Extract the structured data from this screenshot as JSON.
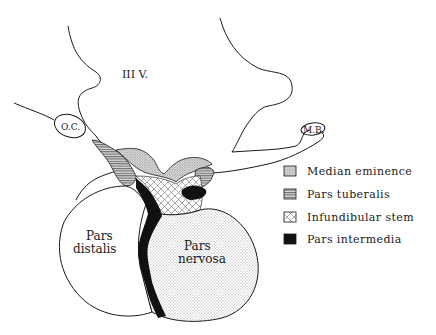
{
  "diagram": {
    "type": "anatomical-section",
    "labels": {
      "third_ventricle": "III V.",
      "optic_chiasm": "O.C.",
      "mammillary_body": "M.B.",
      "pars_distalis_line1": "Pars",
      "pars_distalis_line2": "distalis",
      "pars_nervosa_line1": "Pars",
      "pars_nervosa_line2": "nervosa"
    },
    "legend": [
      {
        "label": "Median eminence",
        "pattern": "fine-dot-crosshatch"
      },
      {
        "label": "Pars tuberalis",
        "pattern": "horizontal-lines"
      },
      {
        "label": "Infundibular stem",
        "pattern": "diagonal-crosshatch"
      },
      {
        "label": "Pars intermedia",
        "pattern": "solid-black"
      }
    ],
    "colors": {
      "ink": "#1a1a1a",
      "background": "#ffffff"
    }
  }
}
